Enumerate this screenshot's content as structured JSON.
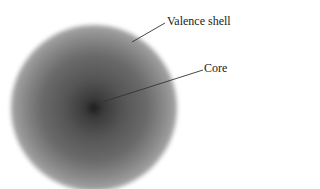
{
  "diagram": {
    "labels": [
      {
        "id": "valence",
        "text": "Valence shell"
      },
      {
        "id": "core",
        "text": "Core"
      }
    ]
  }
}
